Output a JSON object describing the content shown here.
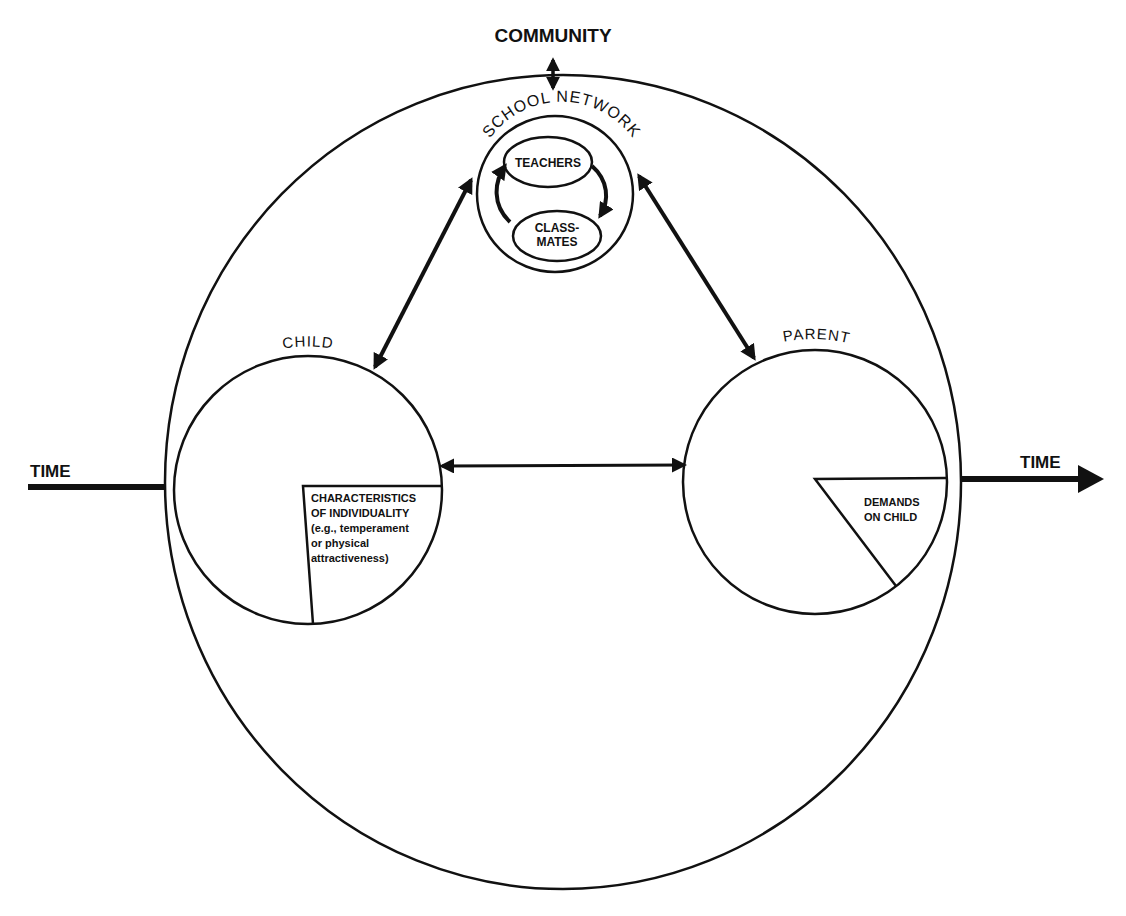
{
  "diagram": {
    "colors": {
      "ink": "#111111",
      "background": "#ffffff"
    },
    "community_label": "COMMUNITY",
    "time_left_label": "TIME",
    "time_right_label": "TIME",
    "school": {
      "label": "SCHOOL NETWORK",
      "teachers_label": "TEACHERS",
      "classmates_line1": "CLASS-",
      "classmates_line2": "MATES"
    },
    "child": {
      "label": "CHILD",
      "segment_lines": [
        "CHARACTERISTICS",
        "OF INDIVIDUALITY",
        "(e.g., temperament",
        "or physical",
        "attractiveness)"
      ]
    },
    "parent": {
      "label": "PARENT",
      "segment_lines": [
        "DEMANDS",
        "ON CHILD"
      ]
    },
    "connections": [
      {
        "from": "community",
        "to": "school-network",
        "type": "bidirectional"
      },
      {
        "from": "school-network",
        "to": "child",
        "type": "bidirectional"
      },
      {
        "from": "school-network",
        "to": "parent",
        "type": "bidirectional"
      },
      {
        "from": "child",
        "to": "parent",
        "type": "bidirectional"
      },
      {
        "from": "teachers",
        "to": "classmates",
        "type": "cyclic"
      }
    ]
  }
}
